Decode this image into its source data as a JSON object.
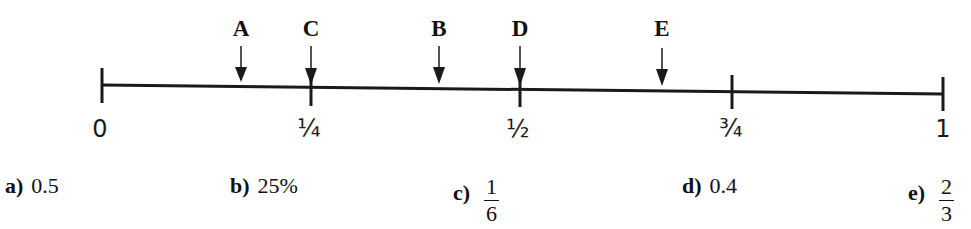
{
  "header": {
    "clipped_text": "question prompt partially visible"
  },
  "number_line": {
    "ticks": [
      {
        "x": 102,
        "label": "0"
      },
      {
        "x": 311,
        "label": "¼"
      },
      {
        "x": 520,
        "label": "½"
      },
      {
        "x": 732,
        "label": "¾"
      },
      {
        "x": 943,
        "label": "1"
      }
    ],
    "markers": [
      {
        "label": "A",
        "x": 241
      },
      {
        "label": "C",
        "x": 311
      },
      {
        "label": "B",
        "x": 439
      },
      {
        "label": "D",
        "x": 520
      },
      {
        "label": "E",
        "x": 662
      }
    ]
  },
  "options": [
    {
      "letter": "a)",
      "value": "0.5"
    },
    {
      "letter": "b)",
      "value": "25%"
    },
    {
      "letter": "c)",
      "numerator": "1",
      "denominator": "6"
    },
    {
      "letter": "d)",
      "value": "0.4"
    },
    {
      "letter": "e)",
      "numerator": "2",
      "denominator": "3"
    }
  ]
}
